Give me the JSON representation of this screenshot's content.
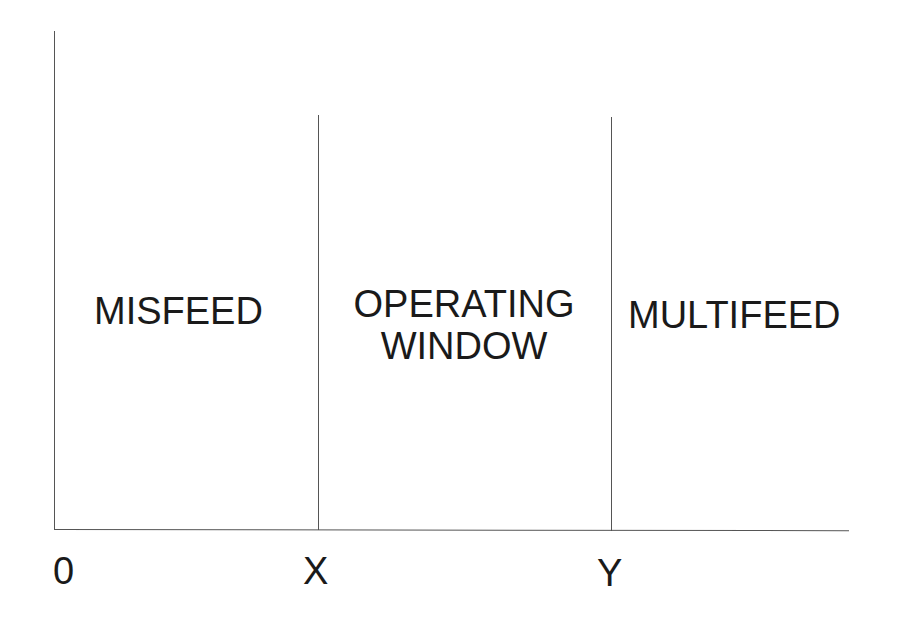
{
  "diagram": {
    "type": "operating-window-diagram",
    "colors": {
      "line": "#555555",
      "text": "#1a1a1a",
      "background": "#ffffff"
    },
    "regions": [
      {
        "label": "MISFEED"
      },
      {
        "label_line1": "OPERATING",
        "label_line2": "WINDOW"
      },
      {
        "label": "MULTIFEED"
      }
    ],
    "axis": {
      "ticks": [
        "0",
        "X",
        "Y"
      ]
    }
  }
}
